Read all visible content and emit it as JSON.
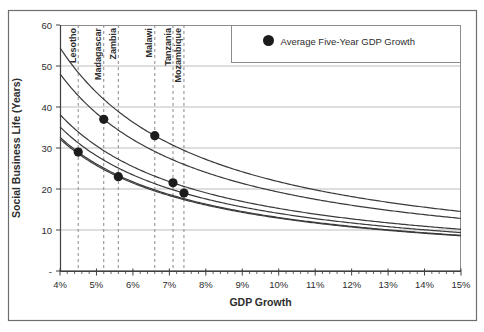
{
  "chart_data": {
    "type": "line",
    "title": "",
    "xlabel": "GDP Growth",
    "ylabel": "Social Business Life (Years)",
    "xlim": [
      4,
      15
    ],
    "ylim": [
      0,
      60
    ],
    "x_major_tick_step": 1,
    "x_minor_tick_step": 0.2,
    "x_tick_labels": [
      "4%",
      "5%",
      "6%",
      "7%",
      "8%",
      "9%",
      "10%",
      "11%",
      "12%",
      "13%",
      "14%",
      "15%"
    ],
    "y_tick_values": [
      0,
      10,
      20,
      30,
      40,
      50,
      60
    ],
    "y_tick_labels": [
      "-",
      "10",
      "20",
      "30",
      "40",
      "50",
      "60"
    ],
    "grid": "horizontal",
    "curve_model": "social_business_life_years = k / gdp_growth_pct, k = avg_gdp_growth_pct * life_years_at_marker",
    "legend": {
      "position": "top-right-inside",
      "marker": "filled-circle",
      "label": "Average Five-Year GDP Growth"
    },
    "series": [
      {
        "name": "Lesotho",
        "avg_gdp_growth_pct": 4.5,
        "social_business_life_years": 29
      },
      {
        "name": "Madagascar",
        "avg_gdp_growth_pct": 5.2,
        "social_business_life_years": 37
      },
      {
        "name": "Zambia",
        "avg_gdp_growth_pct": 5.6,
        "social_business_life_years": 23
      },
      {
        "name": "Malawi",
        "avg_gdp_growth_pct": 6.6,
        "social_business_life_years": 33
      },
      {
        "name": "Tanzania",
        "avg_gdp_growth_pct": 7.1,
        "social_business_life_years": 21.5
      },
      {
        "name": "Mozambique",
        "avg_gdp_growth_pct": 7.4,
        "social_business_life_years": 19
      }
    ],
    "colors": {
      "background": "#ffffff",
      "outer_border": "#6e6e6e",
      "plot_border": "#8c8c8c",
      "grid": "#bdbdbd",
      "marker_line": "#8a8a8a",
      "curve": "#3a3a3a",
      "dot": "#1c1c1c",
      "axis": "#3f3f3f",
      "text": "#2d2d2d"
    }
  }
}
